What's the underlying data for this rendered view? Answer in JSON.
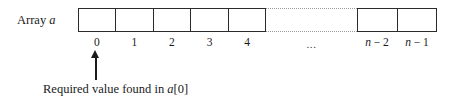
{
  "figure": {
    "array_label": {
      "text": "Array",
      "variable": "a"
    },
    "left_group": {
      "cell_count": 5,
      "indices": [
        "0",
        "1",
        "2",
        "3",
        "4"
      ]
    },
    "gap": {
      "ellipsis": "..."
    },
    "right_group": {
      "cell_count": 2,
      "indices": [
        {
          "var": "n",
          "rest": " − 2"
        },
        {
          "var": "n",
          "rest": " − 1"
        }
      ]
    },
    "pointer": {
      "target_index": "0",
      "caption_prefix": "Required value found in ",
      "caption_variable": "a",
      "caption_suffix": "[0]"
    }
  }
}
